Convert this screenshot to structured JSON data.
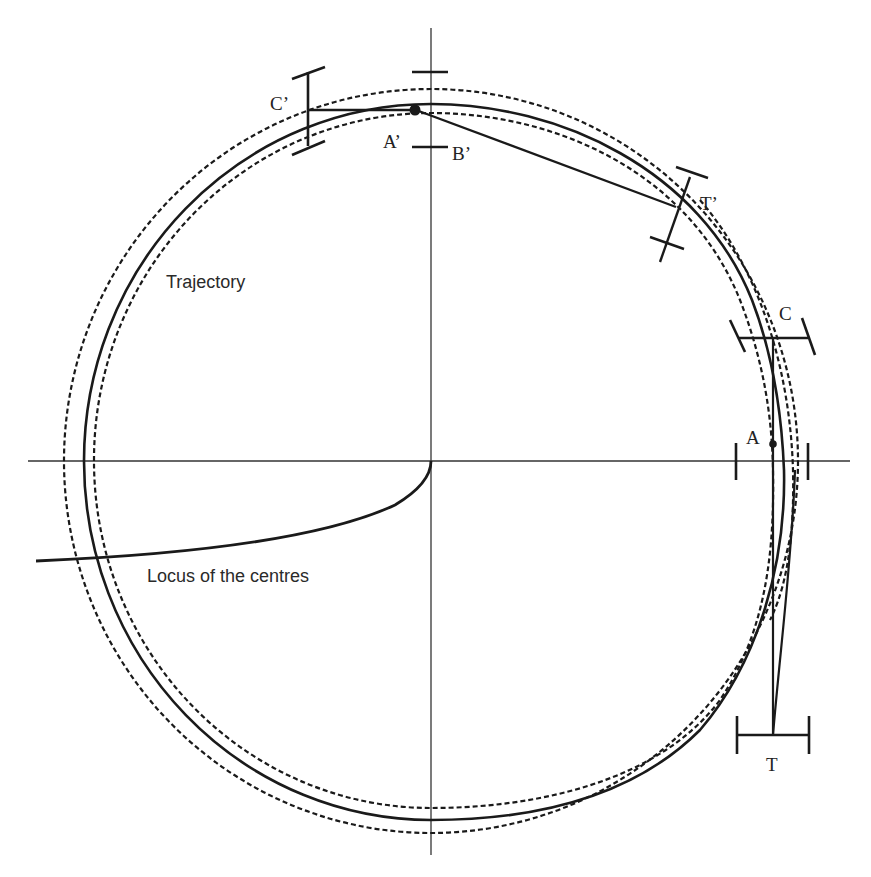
{
  "diagram": {
    "labels": {
      "trajectory": "Trajectory",
      "locus": "Locus of the centres",
      "A": "A",
      "A_prime": "A’",
      "B_prime": "B’",
      "C": "C",
      "C_prime": "C’",
      "T": "T",
      "T_prime": "T’"
    },
    "colors": {
      "stroke": "#1a1a1a",
      "axis": "#333333",
      "background": "#ffffff"
    },
    "elements": [
      "horizontal-axis",
      "vertical-axis",
      "outer-dashed-circle",
      "trajectory-circle",
      "inner-dashed-circle",
      "locus-of-centres-curve",
      "chord-A-prime-to-T-prime",
      "chord-C-prime-to-A-prime",
      "chord-C-to-T",
      "marker-B-prime",
      "marker-C-prime",
      "marker-T-prime",
      "marker-C",
      "marker-A",
      "marker-T",
      "point-A",
      "point-A-prime"
    ]
  }
}
